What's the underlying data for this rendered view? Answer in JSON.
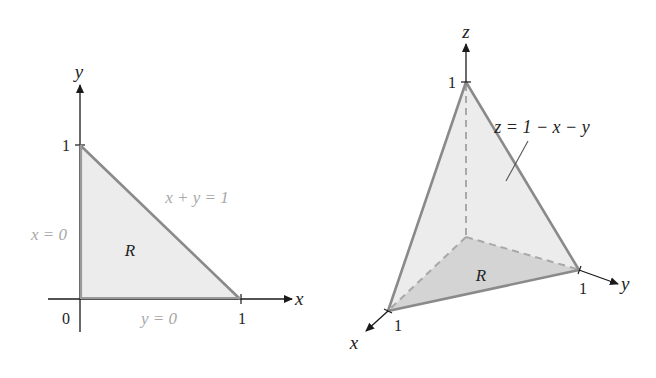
{
  "left_figure": {
    "axes": {
      "x_label": "x",
      "y_label": "y",
      "origin_label": "0",
      "x_tick": "1",
      "y_tick": "1"
    },
    "region_label": "R",
    "boundaries": {
      "hypotenuse": "x + y = 1",
      "left_edge": "x = 0",
      "bottom_edge": "y = 0"
    }
  },
  "right_figure": {
    "axes": {
      "x_label": "x",
      "y_label": "y",
      "z_label": "z",
      "x_tick": "1",
      "y_tick": "1",
      "z_tick": "1"
    },
    "surface_label": "z = 1 − x − y",
    "region_label": "R"
  },
  "colors": {
    "axis": "#1a1a1a",
    "edge": "#8a8a8a",
    "fill_light": "#ececec",
    "fill_dark": "#d4d4d4",
    "faint_label": "#a8a8a8",
    "dark_label": "#222222"
  }
}
